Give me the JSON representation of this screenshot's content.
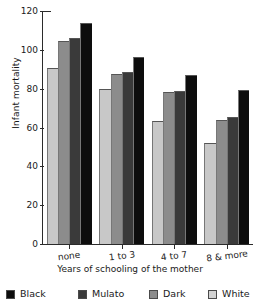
{
  "chart_data": {
    "type": "bar",
    "title": "",
    "xlabel": "Years of schooling of the mother",
    "ylabel": "Infant mortality",
    "categories": [
      "none",
      "1 to 3",
      "4 to 7",
      "8 & more"
    ],
    "ylim": [
      0,
      120
    ],
    "yticks": [
      0,
      20,
      40,
      60,
      80,
      100,
      120
    ],
    "grid": false,
    "legend_position": "bottom",
    "series": [
      {
        "name": "Black",
        "color": "#0d0d0d",
        "values": [
          114,
          96.5,
          87,
          79.5
        ]
      },
      {
        "name": "Mulato",
        "color": "#3a3a3a",
        "values": [
          106,
          88.5,
          79,
          65.5
        ]
      },
      {
        "name": "Dark",
        "color": "#8c8c8c",
        "values": [
          104.5,
          87.5,
          78.5,
          64
        ]
      },
      {
        "name": "White",
        "color": "#c8c8c8",
        "values": [
          90.5,
          80,
          63.5,
          52
        ]
      }
    ],
    "bar_draw_order": [
      "White",
      "Dark",
      "Mulato",
      "Black"
    ]
  },
  "legend": {
    "items": [
      {
        "label": "Black",
        "color": "#0d0d0d"
      },
      {
        "label": "Mulato",
        "color": "#3a3a3a"
      },
      {
        "label": "Dark",
        "color": "#8c8c8c"
      },
      {
        "label": "White",
        "color": "#d2d2d2"
      }
    ]
  },
  "axes": {
    "y_tick_labels": [
      "120",
      "100",
      "80",
      "60",
      "40",
      "20",
      "0"
    ],
    "y_title": "Infant mortality",
    "x_title": "Years of schooling of the mother",
    "x_tick_labels": [
      "none",
      "1 to 3",
      "4 to 7",
      "8 & more"
    ]
  }
}
